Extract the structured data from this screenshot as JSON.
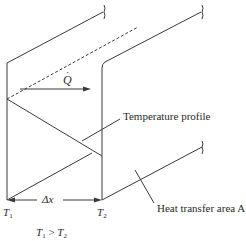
{
  "diagram": {
    "type": "conduction-through-plane-wall",
    "labels": {
      "heat_rate": "Q",
      "temperature_profile": "Temperature profile",
      "heat_transfer_area": "Heat transfer area A",
      "thickness": "Δx",
      "t1": "T",
      "t1_sub": "1",
      "t2": "T",
      "t2_sub": "2",
      "relation_left": "T",
      "relation_left_sub": "1",
      "relation_op": " > ",
      "relation_right": "T",
      "relation_right_sub": "2"
    },
    "colors": {
      "line": "#3a3a3a",
      "text": "#2a2a2a",
      "background": "#ffffff"
    }
  }
}
